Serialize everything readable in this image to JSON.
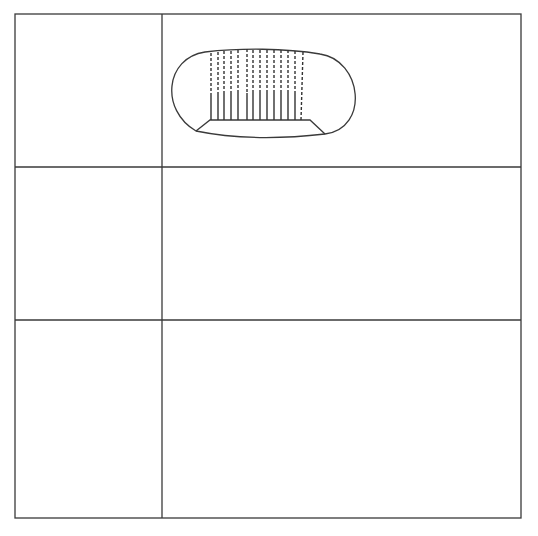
{
  "figure": {
    "rows": [
      {
        "label_lines": [
          "Wild–type embryo"
        ],
        "callouts": [
          {
            "lines": [
              "Dorsal structures"
            ]
          },
          {
            "lines": [
              "Ventral structures"
            ]
          }
        ]
      },
      {
        "label_lines": [
          "Dorsal group mutants"
        ],
        "callouts": [
          {
            "lines": [
              "Dorsal structures",
              "extend to ventral side"
            ]
          }
        ]
      },
      {
        "label_lines": [
          "Mutant injected with",
          "cytoplasm containing",
          "Toll gene product"
        ],
        "callouts": [
          {
            "lines": [
              "Ventral structures develop",
              "around site of injection"
            ]
          }
        ]
      }
    ],
    "colors": {
      "line": "#3a3a3a",
      "text": "#2a2a2a",
      "background": "#ffffff"
    }
  }
}
